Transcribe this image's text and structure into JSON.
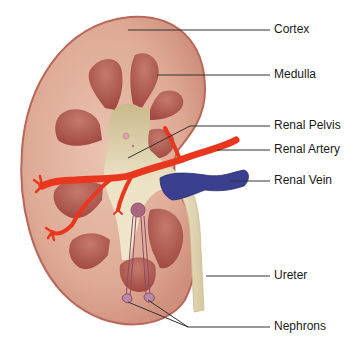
{
  "diagram": {
    "labels": [
      {
        "id": "cortex",
        "text": "Cortex"
      },
      {
        "id": "medulla",
        "text": "Medulla"
      },
      {
        "id": "renal-pelvis",
        "text": "Renal Pelvis"
      },
      {
        "id": "renal-artery",
        "text": "Renal Artery"
      },
      {
        "id": "renal-vein",
        "text": "Renal Vein"
      },
      {
        "id": "ureter",
        "text": "Ureter"
      },
      {
        "id": "nephrons",
        "text": "Nephrons"
      }
    ],
    "colors": {
      "cortex": "#e3b09c",
      "cortex_edge": "#b9675a",
      "medulla": "#b0584f",
      "pelvis": "#e8dcb8",
      "artery": "#e8371e",
      "vein": "#3b3f8f",
      "ureter": "#e6d9b5",
      "nephron": "#a8677e",
      "leader_line": "#333333"
    }
  }
}
